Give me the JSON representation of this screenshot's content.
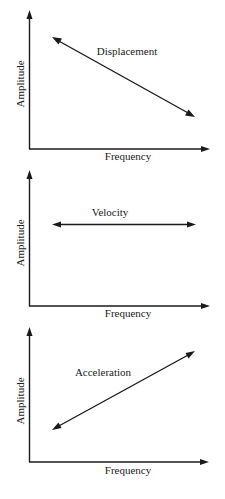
{
  "figure": {
    "panels": [
      {
        "id": "displacement",
        "curve_label": "Displacement",
        "x_axis_label": "Frequency",
        "y_axis_label": "Amplitude",
        "trend": "decreasing"
      },
      {
        "id": "velocity",
        "curve_label": "Velocity",
        "x_axis_label": "Frequency",
        "y_axis_label": "Amplitude",
        "trend": "constant"
      },
      {
        "id": "acceleration",
        "curve_label": "Acceleration",
        "x_axis_label": "Frequency",
        "y_axis_label": "Amplitude",
        "trend": "increasing"
      }
    ],
    "colors": {
      "ink": "#1a1a1a",
      "background": "#ffffff"
    }
  }
}
